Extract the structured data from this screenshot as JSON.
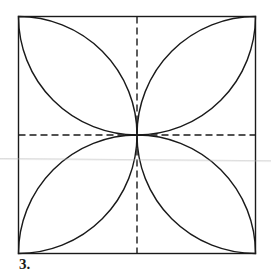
{
  "figure": {
    "caption": "3.",
    "square": {
      "x": 18,
      "y": 16,
      "size": 238
    },
    "stroke_color": "#1a1a1a",
    "dash_pattern": "7,4"
  }
}
